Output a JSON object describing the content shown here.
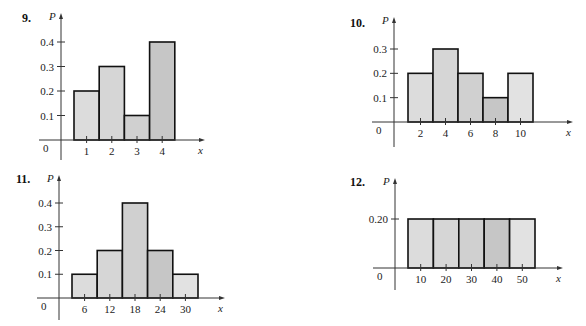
{
  "chart_data": [
    {
      "type": "bar",
      "number": "9.",
      "title": "",
      "xlabel": "x",
      "ylabel": "P",
      "origin_label": "0",
      "categories": [
        "1",
        "2",
        "3",
        "4"
      ],
      "x": [
        1,
        2,
        3,
        4
      ],
      "values": [
        0.2,
        0.3,
        0.1,
        0.4
      ],
      "yticks": [
        "0.1",
        "0.2",
        "0.3",
        "0.4"
      ],
      "ylim": [
        0,
        0.4
      ],
      "fills": [
        "#dcdcdc",
        "#d6d6d6",
        "#d0d0d0",
        "#c6c6c6"
      ],
      "grid": false
    },
    {
      "type": "bar",
      "number": "10.",
      "title": "",
      "xlabel": "x",
      "ylabel": "P",
      "origin_label": "0",
      "categories": [
        "2",
        "4",
        "6",
        "8",
        "10"
      ],
      "x": [
        2,
        4,
        6,
        8,
        10
      ],
      "values": [
        0.2,
        0.3,
        0.2,
        0.1,
        0.2
      ],
      "yticks": [
        "0.1",
        "0.2",
        "0.3"
      ],
      "ylim": [
        0,
        0.3
      ],
      "fills": [
        "#dcdcdc",
        "#d6d6d6",
        "#d0d0d0",
        "#c6c6c6",
        "#e2e2e2"
      ],
      "grid": false
    },
    {
      "type": "bar",
      "number": "11.",
      "title": "",
      "xlabel": "x",
      "ylabel": "P",
      "origin_label": "0",
      "categories": [
        "6",
        "12",
        "18",
        "24",
        "30"
      ],
      "x": [
        6,
        12,
        18,
        24,
        30
      ],
      "values": [
        0.1,
        0.2,
        0.4,
        0.2,
        0.1
      ],
      "yticks": [
        "0.1",
        "0.2",
        "0.3",
        "0.4"
      ],
      "ylim": [
        0,
        0.4
      ],
      "fills": [
        "#dcdcdc",
        "#d6d6d6",
        "#d0d0d0",
        "#c6c6c6",
        "#e2e2e2"
      ],
      "grid": false
    },
    {
      "type": "bar",
      "number": "12.",
      "title": "",
      "xlabel": "x",
      "ylabel": "P",
      "origin_label": "0",
      "categories": [
        "10",
        "20",
        "30",
        "40",
        "50"
      ],
      "x": [
        10,
        20,
        30,
        40,
        50
      ],
      "values": [
        0.2,
        0.2,
        0.2,
        0.2,
        0.2
      ],
      "yticks": [
        "0.20"
      ],
      "ylim": [
        0,
        0.2
      ],
      "fills": [
        "#dcdcdc",
        "#d6d6d6",
        "#d0d0d0",
        "#c6c6c6",
        "#e2e2e2"
      ],
      "grid": false
    }
  ],
  "layout": [
    {
      "axis_x": 61,
      "base_y": 140,
      "top_y": 42,
      "bar_left": 74,
      "bar_w": 25.2,
      "xaxis_end": 200,
      "yaxis_top": 18,
      "yaxis_bottom": 160,
      "num_x": 22,
      "num_y": 22
    },
    {
      "axis_x": 394,
      "base_y": 122,
      "top_y": 49,
      "bar_left": 408,
      "bar_w": 25,
      "xaxis_end": 568,
      "yaxis_top": 22,
      "yaxis_bottom": 147,
      "num_x": 350,
      "num_y": 27
    },
    {
      "axis_x": 59,
      "base_y": 298,
      "top_y": 203,
      "bar_left": 72,
      "bar_w": 25.2,
      "xaxis_end": 220,
      "yaxis_top": 180,
      "yaxis_bottom": 320,
      "num_x": 16,
      "num_y": 183
    },
    {
      "axis_x": 395,
      "base_y": 268,
      "top_y": 219,
      "bar_left": 408,
      "bar_w": 25.4,
      "xaxis_end": 558,
      "yaxis_top": 183,
      "yaxis_bottom": 290,
      "num_x": 350,
      "num_y": 186
    }
  ]
}
